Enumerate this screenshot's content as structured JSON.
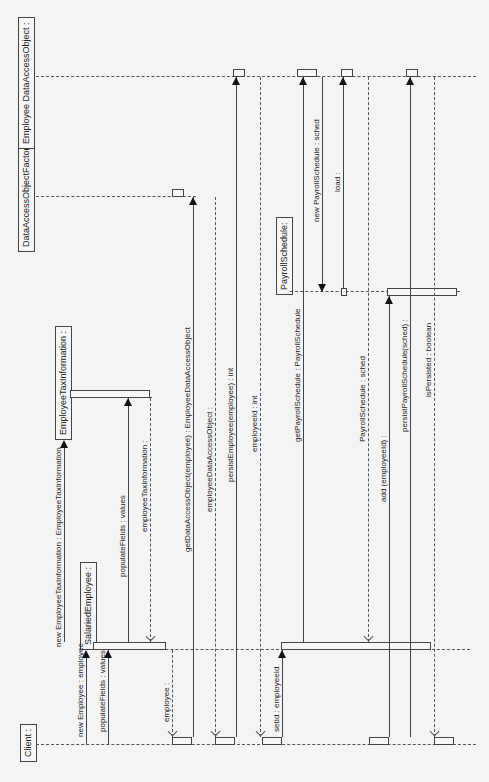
{
  "diagram": {
    "type": "UML sequence diagram",
    "orientation": "rotated 90deg counter-clockwise",
    "colors": {
      "background": "#f4f4f4",
      "line": "#444444",
      "box_fill": "#f6f6f6"
    },
    "lifelines": [
      {
        "id": "client",
        "label": "Client :"
      },
      {
        "id": "salaried",
        "label": "SalariedEmployee :"
      },
      {
        "id": "eti",
        "label": "EmployeeTaxInformation :"
      },
      {
        "id": "daof",
        "label": "DataAccessObjectFactory :"
      },
      {
        "id": "edao",
        "label": "Employee DataAccessObject :"
      },
      {
        "id": "payroll",
        "label": "PayrollSchedule:"
      }
    ],
    "messages": [
      {
        "label": "new Employee : employee",
        "kind": "create"
      },
      {
        "label": "populateFields : values",
        "kind": "sync"
      },
      {
        "label": "new EmployeeTaxInformation : EmployeeTaxInformation",
        "kind": "create"
      },
      {
        "label": "populateFields : values",
        "kind": "sync"
      },
      {
        "label": "employeeTaxInformation :",
        "kind": "return"
      },
      {
        "label": "employee :",
        "kind": "return"
      },
      {
        "label": "getDataAccessObject(employee) : EmployeeDataAccessObject",
        "kind": "sync"
      },
      {
        "label": "employeeDataAccessObject :",
        "kind": "return"
      },
      {
        "label": "persistEmployee(employee) : int",
        "kind": "sync"
      },
      {
        "label": "employeeId : int",
        "kind": "return"
      },
      {
        "label": "setId : employeeId",
        "kind": "sync"
      },
      {
        "label": "getPayrollSchedule : PayrollSchedule",
        "kind": "sync"
      },
      {
        "label": "new PayrollSchedule : sched",
        "kind": "create"
      },
      {
        "label": "load :",
        "kind": "sync"
      },
      {
        "label": "PayrollSchedule : sched",
        "kind": "return"
      },
      {
        "label": "add (employeeId) :",
        "kind": "sync"
      },
      {
        "label": "persistPayrollSchedule(sched) :",
        "kind": "sync"
      },
      {
        "label": "isPersisted : boolean",
        "kind": "return"
      }
    ]
  }
}
